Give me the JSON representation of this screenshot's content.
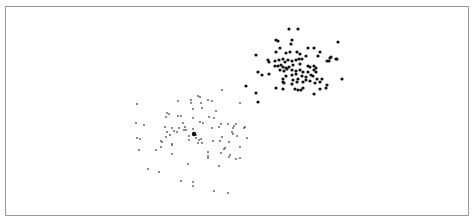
{
  "chart_data": {
    "type": "scatter",
    "title": "",
    "xlabel": "",
    "ylabel": "",
    "grid": false,
    "legend": null,
    "frame": {
      "x": 5,
      "y": 6,
      "width": 463,
      "height": 209,
      "stroke": "#999999"
    },
    "coordinate_space": "pixel (no axes/ticks visible)",
    "series": [
      {
        "name": "cluster-dark",
        "color": "#111111",
        "radius": 1.6,
        "points": [
          [
            289,
            29
          ],
          [
            298,
            29
          ],
          [
            276,
            40
          ],
          [
            278,
            41
          ],
          [
            292,
            40
          ],
          [
            338,
            42
          ],
          [
            280,
            48
          ],
          [
            291,
            44
          ],
          [
            308,
            48
          ],
          [
            314,
            48
          ],
          [
            320,
            52
          ],
          [
            276,
            52
          ],
          [
            256,
            55
          ],
          [
            286,
            53
          ],
          [
            290,
            52
          ],
          [
            297,
            52
          ],
          [
            300,
            54
          ],
          [
            306,
            56
          ],
          [
            318,
            56
          ],
          [
            331,
            57
          ],
          [
            336,
            59
          ],
          [
            330,
            58
          ],
          [
            268,
            60
          ],
          [
            269,
            62
          ],
          [
            275,
            61
          ],
          [
            279,
            60
          ],
          [
            283,
            59
          ],
          [
            285,
            62
          ],
          [
            288,
            60
          ],
          [
            292,
            61
          ],
          [
            296,
            60
          ],
          [
            299,
            59
          ],
          [
            302,
            59
          ],
          [
            337,
            59
          ],
          [
            327,
            61
          ],
          [
            329,
            61
          ],
          [
            275,
            66
          ],
          [
            278,
            66
          ],
          [
            281,
            65
          ],
          [
            283,
            67
          ],
          [
            286,
            68
          ],
          [
            289,
            67
          ],
          [
            293,
            65
          ],
          [
            300,
            64
          ],
          [
            308,
            66
          ],
          [
            310,
            67
          ],
          [
            314,
            66
          ],
          [
            316,
            68
          ],
          [
            280,
            70
          ],
          [
            284,
            71
          ],
          [
            287,
            69
          ],
          [
            292,
            70
          ],
          [
            296,
            71
          ],
          [
            300,
            70
          ],
          [
            303,
            72
          ],
          [
            308,
            72
          ],
          [
            314,
            70
          ],
          [
            316,
            72
          ],
          [
            258,
            72
          ],
          [
            262,
            75
          ],
          [
            269,
            74
          ],
          [
            286,
            76
          ],
          [
            292,
            75
          ],
          [
            296,
            74
          ],
          [
            302,
            76
          ],
          [
            306,
            77
          ],
          [
            311,
            75
          ],
          [
            313,
            76
          ],
          [
            342,
            79
          ],
          [
            283,
            79
          ],
          [
            293,
            80
          ],
          [
            298,
            79
          ],
          [
            303,
            82
          ],
          [
            310,
            81
          ],
          [
            317,
            79
          ],
          [
            322,
            79
          ],
          [
            327,
            85
          ],
          [
            283,
            82
          ],
          [
            284,
            83
          ],
          [
            297,
            82
          ],
          [
            292,
            84
          ],
          [
            306,
            80
          ],
          [
            315,
            83
          ],
          [
            320,
            82
          ],
          [
            276,
            88
          ],
          [
            283,
            89
          ],
          [
            295,
            89
          ],
          [
            298,
            90
          ],
          [
            301,
            90
          ],
          [
            303,
            88
          ],
          [
            314,
            94
          ],
          [
            320,
            89
          ],
          [
            326,
            88
          ],
          [
            246,
            86
          ],
          [
            256,
            93
          ],
          [
            258,
            102
          ]
        ]
      },
      {
        "name": "cluster-light",
        "color": "#555555",
        "radius": 0.9,
        "points": [
          [
            222,
            90
          ],
          [
            198,
            96
          ],
          [
            178,
            101
          ],
          [
            191,
            100
          ],
          [
            200,
            97
          ],
          [
            208,
            100
          ],
          [
            212,
            101
          ],
          [
            137,
            104
          ],
          [
            191,
            103
          ],
          [
            201,
            103
          ],
          [
            240,
            103
          ],
          [
            193,
            109
          ],
          [
            202,
            108
          ],
          [
            216,
            111
          ],
          [
            167,
            113
          ],
          [
            169,
            114
          ],
          [
            166,
            117
          ],
          [
            178,
            116
          ],
          [
            181,
            116
          ],
          [
            193,
            118
          ],
          [
            209,
            117
          ],
          [
            214,
            118
          ],
          [
            136,
            123
          ],
          [
            144,
            125
          ],
          [
            183,
            123
          ],
          [
            200,
            122
          ],
          [
            203,
            123
          ],
          [
            221,
            124
          ],
          [
            228,
            124
          ],
          [
            236,
            124
          ],
          [
            234,
            126
          ],
          [
            165,
            127
          ],
          [
            172,
            128
          ],
          [
            179,
            128
          ],
          [
            185,
            127
          ],
          [
            212,
            128
          ],
          [
            219,
            127
          ],
          [
            233,
            128
          ],
          [
            245,
            127
          ],
          [
            244,
            128
          ],
          [
            167,
            132
          ],
          [
            174,
            131
          ],
          [
            177,
            132
          ],
          [
            184,
            130
          ],
          [
            193,
            129
          ],
          [
            186,
            130
          ],
          [
            194,
            134
          ],
          [
            196,
            135
          ],
          [
            232,
            132
          ],
          [
            137,
            138
          ],
          [
            140,
            139
          ],
          [
            166,
            137
          ],
          [
            170,
            135
          ],
          [
            189,
            136
          ],
          [
            196,
            138
          ],
          [
            201,
            139
          ],
          [
            222,
            137
          ],
          [
            233,
            134
          ],
          [
            237,
            136
          ],
          [
            247,
            138
          ],
          [
            161,
            141
          ],
          [
            162,
            142
          ],
          [
            172,
            144
          ],
          [
            189,
            140
          ],
          [
            199,
            140
          ],
          [
            213,
            141
          ],
          [
            220,
            141
          ],
          [
            198,
            143
          ],
          [
            202,
            143
          ],
          [
            229,
            142
          ],
          [
            139,
            150
          ],
          [
            156,
            150
          ],
          [
            161,
            147
          ],
          [
            172,
            145
          ],
          [
            172,
            154
          ],
          [
            225,
            148
          ],
          [
            224,
            149
          ],
          [
            208,
            152
          ],
          [
            240,
            147
          ],
          [
            208,
            156
          ],
          [
            221,
            153
          ],
          [
            230,
            155
          ],
          [
            236,
            159
          ],
          [
            240,
            158
          ],
          [
            208,
            158
          ],
          [
            229,
            157
          ],
          [
            188,
            164
          ],
          [
            219,
            166
          ],
          [
            148,
            169
          ],
          [
            159,
            172
          ],
          [
            181,
            181
          ],
          [
            193,
            182
          ],
          [
            193,
            186
          ],
          [
            214,
            191
          ],
          [
            228,
            193
          ]
        ]
      }
    ],
    "highlighted_points": [
      {
        "x": 194,
        "y": 134,
        "color": "#111111",
        "radius": 2.2
      }
    ]
  }
}
